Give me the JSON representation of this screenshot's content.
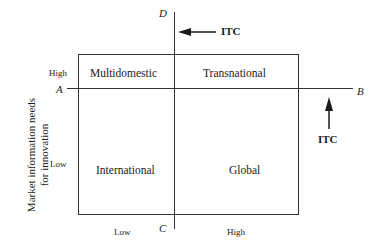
{
  "diagram": {
    "y_axis_label": {
      "line1": "Market information needs",
      "line2": "for innovation"
    },
    "y_ticks": {
      "high": "High",
      "low": "Low"
    },
    "x_ticks": {
      "low": "Low",
      "high": "High"
    },
    "axis_poles": {
      "A": "A",
      "B": "B",
      "C": "C",
      "D": "D"
    },
    "quadrants": {
      "top_left": "Multidomestic",
      "top_right": "Transnational",
      "bottom_left": "International",
      "bottom_right": "Global"
    },
    "arrows": {
      "top": {
        "label": "ITC",
        "direction": "left"
      },
      "right": {
        "label": "ITC",
        "direction": "up"
      }
    },
    "colors": {
      "line": "#333333",
      "text": "#1a1a1a",
      "background": "#ffffff"
    }
  }
}
